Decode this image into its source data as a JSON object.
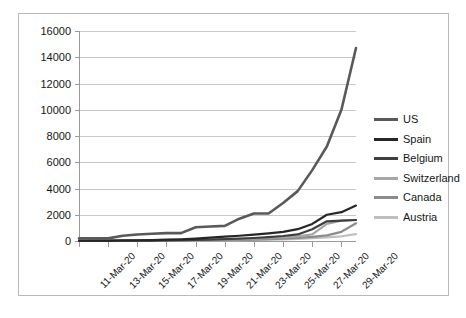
{
  "chart_data": {
    "type": "line",
    "title": "",
    "xlabel": "",
    "ylabel": "",
    "ylim": [
      0,
      16000
    ],
    "ytick_step": 2000,
    "yticks": [
      0,
      2000,
      4000,
      6000,
      8000,
      10000,
      12000,
      14000,
      16000
    ],
    "grid": true,
    "legend_position": "right",
    "x": [
      "11-Mar-20",
      "12-Mar-20",
      "13-Mar-20",
      "14-Mar-20",
      "15-Mar-20",
      "16-Mar-20",
      "17-Mar-20",
      "18-Mar-20",
      "19-Mar-20",
      "20-Mar-20",
      "21-Mar-20",
      "22-Mar-20",
      "23-Mar-20",
      "24-Mar-20",
      "25-Mar-20",
      "26-Mar-20",
      "27-Mar-20",
      "28-Mar-20",
      "29-Mar-20",
      "30-Mar-20"
    ],
    "xtick_labels": [
      "11-Mar-20",
      "13-Mar-20",
      "15-Mar-20",
      "17-Mar-20",
      "19-Mar-20",
      "21-Mar-20",
      "23-Mar-20",
      "25-Mar-20",
      "27-Mar-20",
      "29-Mar-20"
    ],
    "series": [
      {
        "name": "US",
        "color": "#595959",
        "values": [
          200,
          200,
          200,
          400,
          500,
          550,
          600,
          600,
          1050,
          1100,
          1150,
          1700,
          2100,
          2100,
          2900,
          3800,
          5400,
          7200,
          10000,
          14700
        ]
      },
      {
        "name": "Spain",
        "color": "#262626",
        "values": [
          20,
          25,
          30,
          40,
          50,
          70,
          100,
          130,
          180,
          250,
          330,
          400,
          480,
          580,
          700,
          900,
          1300,
          2000,
          2200,
          2700
        ]
      },
      {
        "name": "Belgium",
        "color": "#3f3f3f",
        "values": [
          10,
          12,
          15,
          20,
          25,
          35,
          45,
          60,
          80,
          110,
          140,
          180,
          230,
          300,
          380,
          500,
          900,
          1500,
          1550,
          1600
        ]
      },
      {
        "name": "Switzerland",
        "color": "#a6a6a6",
        "values": [
          8,
          10,
          14,
          18,
          25,
          32,
          42,
          55,
          70,
          90,
          115,
          145,
          180,
          230,
          290,
          360,
          500,
          1300,
          1550,
          1600
        ]
      },
      {
        "name": "Canada",
        "color": "#8c8c8c",
        "values": [
          5,
          6,
          8,
          10,
          14,
          18,
          24,
          30,
          40,
          52,
          68,
          88,
          112,
          145,
          185,
          240,
          320,
          430,
          700,
          1350
        ]
      },
      {
        "name": "Austria",
        "color": "#bfbfbf",
        "values": [
          4,
          5,
          6,
          8,
          10,
          13,
          17,
          22,
          28,
          36,
          46,
          60,
          78,
          100,
          128,
          165,
          215,
          280,
          360,
          520
        ]
      }
    ]
  },
  "axes": {
    "grid_color": "#c8c8c8",
    "axis_color": "#9a9a9a",
    "border_color": "#b9b9b9"
  }
}
